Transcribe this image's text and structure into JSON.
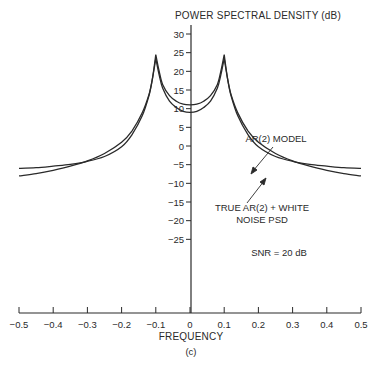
{
  "chart_data": {
    "type": "line",
    "title": "POWER SPECTRAL DENSITY (dB)",
    "xlabel": "FREQUENCY",
    "ylabel": "POWER SPECTRAL DENSITY (dB)",
    "caption": "(c)",
    "xlim": [
      -0.5,
      0.5
    ],
    "ylim": [
      -30,
      30
    ],
    "grid": false,
    "x_ticks": [
      -0.5,
      -0.4,
      -0.3,
      -0.2,
      -0.1,
      0,
      0.1,
      0.2,
      0.3,
      0.4,
      0.5
    ],
    "x_tick_labels": [
      "−0.5",
      "−0.4",
      "−0.3",
      "−0.2",
      "−0.1",
      "0",
      "0.1",
      "0.2",
      "0.3",
      "0.4",
      "0.5"
    ],
    "y_ticks": [
      30,
      25,
      20,
      15,
      10,
      5,
      0,
      -5,
      -10,
      -15,
      -20,
      -25
    ],
    "y_tick_labels": [
      "30",
      "25",
      "20",
      "15",
      "10",
      "5",
      "0",
      "−5",
      "−10",
      "−15",
      "−20",
      "−25"
    ],
    "series": [
      {
        "name": "TRUE AR(2) + WHITE NOISE PSD",
        "x": [
          -0.5,
          -0.45,
          -0.4,
          -0.35,
          -0.3,
          -0.25,
          -0.2,
          -0.17,
          -0.14,
          -0.12,
          -0.11,
          -0.1,
          -0.09,
          -0.08,
          -0.06,
          -0.04,
          -0.02,
          0,
          0.02,
          0.04,
          0.06,
          0.08,
          0.09,
          0.1,
          0.11,
          0.12,
          0.14,
          0.17,
          0.2,
          0.25,
          0.3,
          0.35,
          0.4,
          0.45,
          0.5
        ],
        "values": [
          -6,
          -5.8,
          -5.4,
          -4.9,
          -4.1,
          -2.8,
          -0.2,
          3,
          8,
          13.5,
          18,
          24.5,
          20,
          16.5,
          13.5,
          12,
          11.2,
          11,
          11.2,
          12,
          13.5,
          16.5,
          20,
          24.5,
          18,
          13.5,
          8,
          3,
          -0.2,
          -2.8,
          -4.1,
          -4.9,
          -5.4,
          -5.8,
          -6
        ]
      },
      {
        "name": "AR(2) MODEL",
        "x": [
          -0.5,
          -0.45,
          -0.4,
          -0.35,
          -0.3,
          -0.25,
          -0.2,
          -0.17,
          -0.14,
          -0.12,
          -0.11,
          -0.1,
          -0.09,
          -0.08,
          -0.06,
          -0.04,
          -0.02,
          0,
          0.02,
          0.04,
          0.06,
          0.08,
          0.09,
          0.1,
          0.11,
          0.12,
          0.14,
          0.17,
          0.2,
          0.25,
          0.3,
          0.35,
          0.4,
          0.45,
          0.5
        ],
        "values": [
          -8,
          -7.4,
          -6.5,
          -5.4,
          -4,
          -2,
          1,
          4,
          8.8,
          13.8,
          18,
          23.5,
          19,
          15.5,
          12,
          10.3,
          9.3,
          9,
          9.3,
          10.3,
          12,
          15.5,
          19,
          23.5,
          18,
          13.8,
          8.8,
          4,
          1,
          -2,
          -4,
          -5.4,
          -6.5,
          -7.4,
          -8
        ]
      }
    ],
    "annotations": [
      {
        "text": "AR(2) MODEL",
        "points_to": "AR(2) MODEL"
      },
      {
        "text_lines": [
          "TRUE AR(2) + WHITE",
          "NOISE PSD"
        ],
        "points_to": "TRUE AR(2) + WHITE NOISE PSD"
      },
      {
        "text": "SNR = 20 dB"
      }
    ]
  },
  "labels": {
    "title": "POWER SPECTRAL DENSITY (dB)",
    "xlabel": "FREQUENCY",
    "caption": "(c)",
    "ann_model": "AR(2) MODEL",
    "ann_true_line1": "TRUE AR(2) + WHITE",
    "ann_true_line2": "NOISE PSD",
    "ann_snr": "SNR = 20 dB"
  },
  "colors": {
    "ink": "#2a2a2a",
    "background": "#ffffff"
  }
}
